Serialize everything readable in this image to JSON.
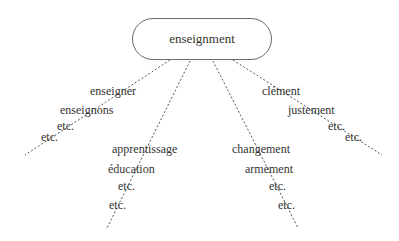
{
  "root": {
    "label": "enseignment"
  },
  "branches": [
    {
      "name": "verbs",
      "items": [
        "enseigner",
        "enseignons",
        "etc.",
        "etc."
      ]
    },
    {
      "name": "nouns-tion",
      "items": [
        "apprentissage",
        "éducation",
        "etc.",
        "etc."
      ]
    },
    {
      "name": "nouns-ment",
      "items": [
        "changement",
        "armement",
        "etc.",
        "etc."
      ]
    },
    {
      "name": "adverbs",
      "items": [
        "clément",
        "justement",
        "etc.",
        "etc."
      ]
    }
  ],
  "colors": {
    "line": "#555555",
    "text": "#333333",
    "border": "#6b6b6b"
  }
}
